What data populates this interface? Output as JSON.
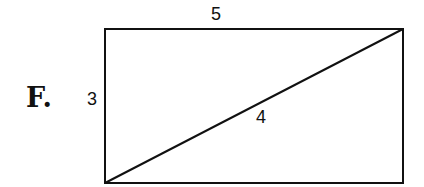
{
  "figure": {
    "option_label": "F.",
    "sides": {
      "top": "5",
      "left": "3",
      "diagonal": "4"
    },
    "shape": "rectangle-with-diagonal"
  }
}
